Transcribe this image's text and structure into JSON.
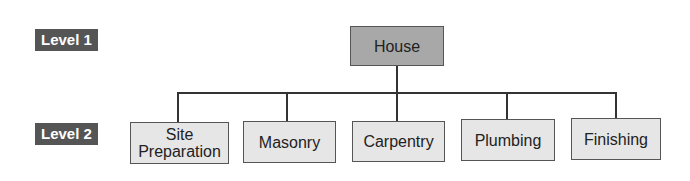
{
  "levels": [
    {
      "label": "Level 1"
    },
    {
      "label": "Level 2"
    }
  ],
  "tree": {
    "root": {
      "label": "House"
    },
    "children": [
      {
        "label": "Site Preparation"
      },
      {
        "label": "Masonry"
      },
      {
        "label": "Carpentry"
      },
      {
        "label": "Plumbing"
      },
      {
        "label": "Finishing"
      }
    ]
  },
  "colors": {
    "label_bg": "#555555",
    "root_fill": "#a8a8a8",
    "child_fill": "#e6e6e6",
    "connector": "#333333"
  }
}
